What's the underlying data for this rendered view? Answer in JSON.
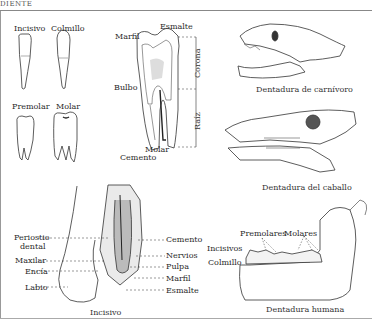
{
  "header": {
    "running_head": "DIENTE"
  },
  "panels": {
    "tooth_types": {
      "labels": [
        "Incisivo",
        "Colmillo",
        "Premolar",
        "Molar"
      ]
    },
    "molar_section": {
      "labels": {
        "esmalte": "Esmalte",
        "marfil": "Marfil",
        "bulbo": "Bulbo",
        "cemento": "Cemento",
        "molar": "Molar",
        "corona": "Corona",
        "raiz": "Raíz"
      }
    },
    "carnivore": {
      "caption": "Dentadura de carnívoro"
    },
    "horse": {
      "caption": "Dentadura del caballo"
    },
    "incisor_section": {
      "caption": "Incisivo",
      "left_labels": [
        "Periostio",
        "dental",
        "Maxilar",
        "Encía",
        "Labio"
      ],
      "right_labels": [
        "Cemento",
        "Nervios",
        "Pulpa",
        "Marfil",
        "Esmalte"
      ]
    },
    "human": {
      "caption": "Dentadura humana",
      "labels": {
        "premolares": "Premolares",
        "molares": "Molares",
        "incisivos": "Incisivos",
        "colmillo": "Colmillo"
      }
    }
  },
  "colors": {
    "ink": "#2a2a2a",
    "rule": "#888888",
    "background": "#ffffff"
  }
}
